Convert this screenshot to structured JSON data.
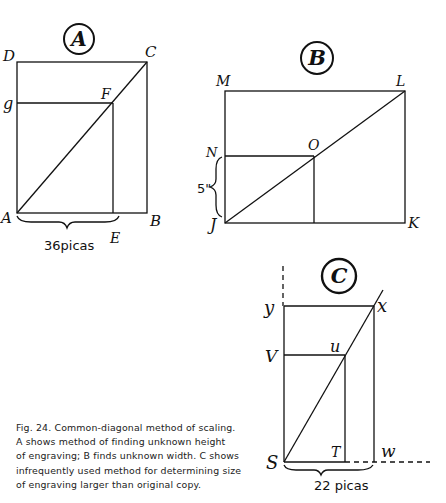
{
  "diagrams": {
    "A": {
      "badge": "A",
      "labels": {
        "D": "D",
        "C": "C",
        "G": "g",
        "F": "F",
        "A": "A",
        "B": "B",
        "E": "E"
      },
      "measure": "36picas"
    },
    "B": {
      "badge": "B",
      "labels": {
        "M": "M",
        "L": "L",
        "N": "N",
        "O": "O",
        "J": "J",
        "K": "K"
      },
      "measure": "5\""
    },
    "C": {
      "badge": "C",
      "labels": {
        "Y": "y",
        "X": "x",
        "V": "V",
        "U": "u",
        "S": "S",
        "T": "T",
        "W": "w"
      },
      "measure": "22 picas"
    }
  },
  "caption": {
    "lines": [
      "Fig. 24. Common-diagonal method of scaling.",
      "A shows method of finding unknown height",
      "of engraving; B finds unknown width. C shows",
      "infrequently used method for determining size",
      "of engraving larger than original copy."
    ]
  }
}
